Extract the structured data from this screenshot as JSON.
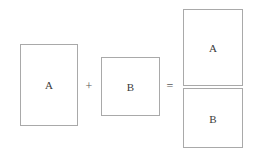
{
  "diagram": {
    "colors": {
      "background": "#ffffff",
      "border": "#a9a9a9",
      "label_text": "#3b3b3b",
      "operator_text": "#5a5a5a"
    },
    "operands": [
      {
        "id": "a",
        "label": "A",
        "shape": "portrait-rectangle",
        "x": 20,
        "y": 44,
        "width": 58,
        "height": 82
      },
      {
        "id": "b",
        "label": "B",
        "shape": "square",
        "x": 101,
        "y": 57,
        "width": 59,
        "height": 59
      }
    ],
    "operators": [
      {
        "id": "plus",
        "symbol": "+",
        "x": 89,
        "y": 86
      },
      {
        "id": "equals",
        "symbol": "=",
        "x": 170,
        "y": 86
      }
    ],
    "result": {
      "id": "composite",
      "x": 183,
      "y": 9,
      "width": 60,
      "height": 139,
      "cells": [
        {
          "id": "composite-a",
          "label": "A",
          "position": "top",
          "height": 77
        },
        {
          "id": "composite-b",
          "label": "B",
          "position": "bottom",
          "height": 60
        }
      ]
    }
  }
}
